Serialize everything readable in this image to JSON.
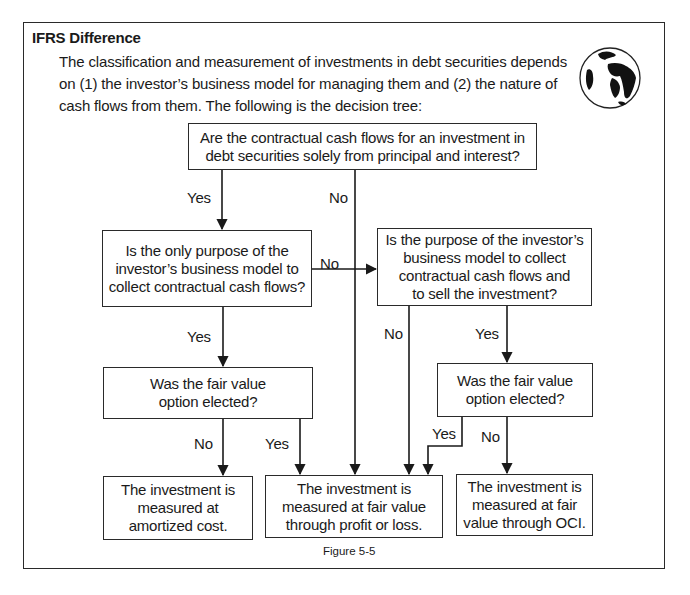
{
  "header": {
    "title": "IFRS Difference",
    "intro_lines": [
      "The classification and measurement of investments in debt securities depends",
      "on (1) the investor’s business model for managing them and (2) the nature of",
      "cash flows from them. The following is the decision tree:"
    ],
    "icon": "globe-icon"
  },
  "nodes": {
    "q_sppi": [
      "Are the contractual cash flows for an investment in",
      "debt securities solely from principal and interest?"
    ],
    "q_collect": [
      "Is the only purpose of the",
      "investor’s business model to",
      "collect contractual cash flows?"
    ],
    "q_collect_sell": [
      "Is the purpose of the investor’s",
      "business model to collect",
      "contractual cash flows and",
      "to sell the investment?"
    ],
    "q_fvo_left": [
      "Was the fair value",
      "option elected?"
    ],
    "q_fvo_right": [
      "Was the fair value",
      "option elected?"
    ],
    "out_amortized": [
      "The investment is",
      "measured at",
      "amortized cost."
    ],
    "out_fvpl": [
      "The investment is",
      "measured at fair value",
      "through profit or loss."
    ],
    "out_fvoci": [
      "The investment is",
      "measured at fair",
      "value through OCI."
    ]
  },
  "edge_labels": {
    "sppi_yes": "Yes",
    "sppi_no": "No",
    "collect_no": "No",
    "collect_yes": "Yes",
    "collect_sell_no": "No",
    "collect_sell_yes": "Yes",
    "fvo_left_no": "No",
    "fvo_left_yes": "Yes",
    "fvo_right_yes": "Yes",
    "fvo_right_no": "No"
  },
  "caption": "Figure 5-5"
}
